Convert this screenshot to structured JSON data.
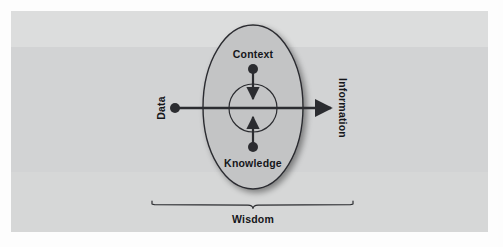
{
  "diagram": {
    "title_visible": false,
    "type": "dikw-concentric-flow",
    "background": {
      "page_color": "#fdfdfd",
      "panel_color": "#d4d5d6",
      "panel_band_top_color": "#dcdddd",
      "panel_band_mid_color": "#d2d3d4",
      "panel_band_bottom_color": "#d6d7d7"
    },
    "colors": {
      "stroke": "#2b2c30",
      "text": "#15161a",
      "ellipse_fill": "#c3c4c5",
      "inner_circle_fill": "none"
    },
    "shapes": {
      "outer_ellipse": {
        "cx": 253,
        "cy": 107,
        "rx": 50,
        "ry": 82
      },
      "inner_circle": {
        "cx": 253,
        "cy": 108,
        "r": 24
      }
    },
    "nodes": [
      {
        "id": "context",
        "label": "Context",
        "dot": {
          "cx": 253,
          "cy": 69,
          "r": 5
        },
        "label_pos": {
          "x": 253,
          "y": 54
        }
      },
      {
        "id": "knowledge",
        "label": "Knowledge",
        "dot": {
          "cx": 253,
          "cy": 147,
          "r": 5
        },
        "label_pos": {
          "x": 253,
          "y": 163
        }
      },
      {
        "id": "data",
        "label": "Data",
        "dot": {
          "cx": 175,
          "cy": 108,
          "r": 5
        },
        "label_pos": {
          "x": 161,
          "y": 108
        },
        "rotation": -90
      },
      {
        "id": "information",
        "label": "Information",
        "label_pos": {
          "x": 343,
          "y": 108
        },
        "rotation": 90
      }
    ],
    "arrows": [
      {
        "id": "data-to-information",
        "from": "data",
        "to": "information",
        "direction": "right",
        "x1": 175,
        "y1": 108,
        "x2": 331,
        "y2": 108
      },
      {
        "id": "context-down",
        "from": "context",
        "to": "center",
        "direction": "down",
        "x1": 253,
        "y1": 74,
        "x2": 253,
        "y2": 98
      },
      {
        "id": "knowledge-up",
        "from": "knowledge",
        "to": "center",
        "direction": "up",
        "x1": 253,
        "y1": 142,
        "x2": 253,
        "y2": 118
      }
    ],
    "brace": {
      "label": "Wisdom",
      "left_x": 152,
      "right_x": 353,
      "top_y": 201,
      "tip_y": 208,
      "label_pos": {
        "x": 253,
        "y": 219
      }
    }
  }
}
